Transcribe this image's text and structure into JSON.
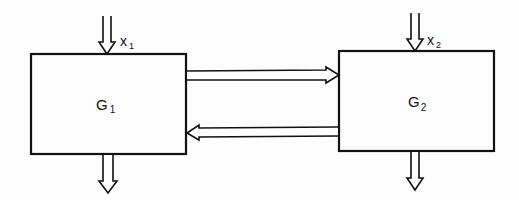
{
  "diagram": {
    "type": "block-diagram",
    "background": "#fdfdfd",
    "stroke_color": "#111111",
    "blocks": [
      {
        "id": "G1",
        "label": "G",
        "subscript": "1",
        "x": 31,
        "y": 54,
        "w": 155,
        "h": 100
      },
      {
        "id": "G2",
        "label": "G",
        "subscript": "2",
        "x": 339,
        "y": 51,
        "w": 155,
        "h": 100
      }
    ],
    "inputs": [
      {
        "target": "G1",
        "label": "x",
        "subscript": "1"
      },
      {
        "target": "G2",
        "label": "x",
        "subscript": "2"
      }
    ],
    "outputs": [
      {
        "source": "G1"
      },
      {
        "source": "G2"
      }
    ],
    "connections": [
      {
        "from": "G1",
        "to": "G2",
        "direction": "right"
      },
      {
        "from": "G2",
        "to": "G1",
        "direction": "left"
      }
    ]
  }
}
